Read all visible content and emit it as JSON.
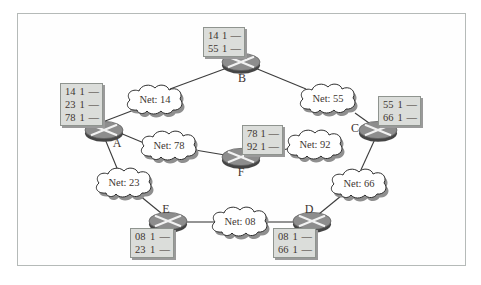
{
  "palette": {
    "frame_border": "#b5bab8",
    "router_fill": "#8d8d8d",
    "router_underside": "#454545",
    "router_x": "#f2f2f2",
    "cloud_fill": "#ffffff",
    "cloud_outline": "#2f2f2f",
    "cloud_shadow": "#8f8f8f",
    "box_fill": "#dbddda",
    "box_border": "#8f948f",
    "link_color": "#3c3c3c",
    "text_color": "#3e3531"
  },
  "routers": {
    "a": {
      "label": "A"
    },
    "b": {
      "label": "B"
    },
    "c": {
      "label": "C"
    },
    "d": {
      "label": "D"
    },
    "e": {
      "label": "E"
    },
    "f": {
      "label": "F"
    }
  },
  "clouds": {
    "net14": {
      "label": "Net: 14"
    },
    "net55": {
      "label": "Net: 55"
    },
    "net78": {
      "label": "Net: 78"
    },
    "net92": {
      "label": "Net: 92"
    },
    "net23": {
      "label": "Net: 23"
    },
    "net66": {
      "label": "Net: 66"
    },
    "net08": {
      "label": "Net: 08"
    }
  },
  "tables": {
    "a": {
      "rows": [
        [
          "14",
          "1",
          "—"
        ],
        [
          "23",
          "1",
          "—"
        ],
        [
          "78",
          "1",
          "—"
        ]
      ]
    },
    "b": {
      "rows": [
        [
          "14",
          "1",
          "—"
        ],
        [
          "55",
          "1",
          "—"
        ]
      ]
    },
    "c": {
      "rows": [
        [
          "55",
          "1",
          "—"
        ],
        [
          "66",
          "1",
          "—"
        ]
      ]
    },
    "d": {
      "rows": [
        [
          "08",
          "1",
          "—"
        ],
        [
          "66",
          "1",
          "—"
        ]
      ]
    },
    "e": {
      "rows": [
        [
          "08",
          "1",
          "—"
        ],
        [
          "23",
          "1",
          "—"
        ]
      ]
    },
    "f": {
      "rows": [
        [
          "78",
          "1",
          "—"
        ],
        [
          "92",
          "1",
          "—"
        ]
      ]
    }
  }
}
